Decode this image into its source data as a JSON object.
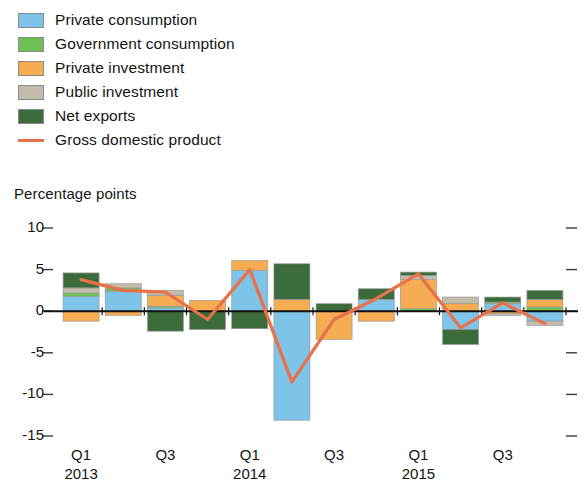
{
  "axis_title": "Percentage points",
  "legend": [
    {
      "label": "Private consumption",
      "color": "#7ec3e8",
      "type": "swatch"
    },
    {
      "label": "Government consumption",
      "color": "#6fc053",
      "type": "swatch"
    },
    {
      "label": "Private investment",
      "color": "#f5ac52",
      "type": "swatch"
    },
    {
      "label": "Public investment",
      "color": "#c4bcab",
      "type": "swatch"
    },
    {
      "label": "Net exports",
      "color": "#3c6b3c",
      "type": "swatch"
    },
    {
      "label": "Gross domestic product",
      "color": "#e8714a",
      "type": "line"
    }
  ],
  "chart_data": {
    "type": "bar",
    "title": "",
    "subtitle": "",
    "xlabel": "",
    "ylabel": "Percentage points",
    "ylim": [
      -15,
      10
    ],
    "yticks": [
      10,
      5,
      0,
      -5,
      -10,
      -15
    ],
    "ytick_labels": [
      "10",
      "5",
      "0",
      "-5",
      "-10",
      "-15"
    ],
    "grid": false,
    "legend_position": "top-left",
    "stacked": true,
    "categories": [
      "Q1 2013",
      "Q2 2013",
      "Q3 2013",
      "Q4 2013",
      "Q1 2014",
      "Q2 2014",
      "Q3 2014",
      "Q4 2014",
      "Q1 2015",
      "Q2 2015",
      "Q3 2015",
      "Q4 2015"
    ],
    "xtick_labels": [
      {
        "quarter": "Q1",
        "year": "2013",
        "index": 0
      },
      {
        "quarter": "Q3",
        "year": "",
        "index": 2
      },
      {
        "quarter": "Q1",
        "year": "2014",
        "index": 4
      },
      {
        "quarter": "Q3",
        "year": "",
        "index": 6
      },
      {
        "quarter": "Q1",
        "year": "2015",
        "index": 8
      },
      {
        "quarter": "Q3",
        "year": "",
        "index": 10
      }
    ],
    "series": [
      {
        "name": "Private consumption",
        "color": "#7ec3e8",
        "values": [
          1.8,
          2.4,
          0.4,
          0.0,
          4.9,
          -13.1,
          0.0,
          1.4,
          0.0,
          -2.2,
          0.9,
          -1.2
        ]
      },
      {
        "name": "Government consumption",
        "color": "#6fc053",
        "values": [
          0.4,
          0.4,
          0.2,
          0.0,
          0.0,
          0.0,
          0.0,
          0.0,
          0.3,
          0.0,
          0.2,
          0.5
        ]
      },
      {
        "name": "Private investment",
        "color": "#f5ac52",
        "values": [
          -1.2,
          -0.5,
          1.3,
          1.3,
          1.2,
          1.4,
          -3.4,
          -1.2,
          3.5,
          0.9,
          -0.3,
          0.9
        ]
      },
      {
        "name": "Public investment",
        "color": "#c4bcab",
        "values": [
          0.6,
          0.5,
          0.6,
          0.0,
          0.0,
          0.0,
          0.0,
          0.0,
          0.5,
          0.8,
          -0.2,
          -0.5
        ]
      },
      {
        "name": "Net exports",
        "color": "#3c6b3c",
        "values": [
          1.8,
          0.0,
          -2.4,
          -2.2,
          -2.1,
          4.3,
          0.9,
          1.3,
          0.4,
          -1.8,
          0.6,
          1.1
        ]
      }
    ],
    "line_series": {
      "name": "Gross domestic product",
      "color": "#e8714a",
      "values": [
        3.8,
        2.5,
        2.3,
        -1.0,
        5.0,
        -8.5,
        -1.0,
        1.5,
        4.5,
        -2.0,
        1.0,
        -1.5
      ]
    }
  }
}
